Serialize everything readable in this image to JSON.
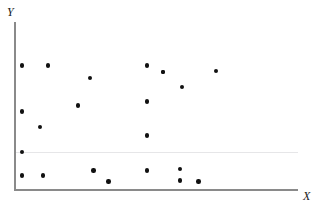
{
  "chart_data": {
    "type": "scatter",
    "title": "",
    "subtitle": "",
    "xlabel": "X",
    "ylabel": "Y",
    "xlim": [
      0,
      100
    ],
    "ylim": [
      0,
      100
    ],
    "grid": false,
    "legend": null,
    "series": [
      {
        "name": "observations",
        "marker": "filled-circle",
        "color": "#111111",
        "point_count": 22,
        "points": [
          {
            "x": 2.5,
            "y": 74.0
          },
          {
            "x": 11.7,
            "y": 74.0
          },
          {
            "x": 26.6,
            "y": 66.5
          },
          {
            "x": 46.8,
            "y": 74.0
          },
          {
            "x": 52.5,
            "y": 70.0
          },
          {
            "x": 59.2,
            "y": 61.0
          },
          {
            "x": 71.3,
            "y": 70.5
          },
          {
            "x": 2.5,
            "y": 46.5
          },
          {
            "x": 8.9,
            "y": 37.0
          },
          {
            "x": 22.3,
            "y": 50.0
          },
          {
            "x": 46.8,
            "y": 52.5
          },
          {
            "x": 46.8,
            "y": 32.0
          },
          {
            "x": 2.5,
            "y": 22.0
          },
          {
            "x": 2.5,
            "y": 8.0
          },
          {
            "x": 9.9,
            "y": 8.0
          },
          {
            "x": 27.9,
            "y": 11.0
          },
          {
            "x": 33.2,
            "y": 4.5
          },
          {
            "x": 46.8,
            "y": 11.0
          },
          {
            "x": 58.5,
            "y": 12.0
          },
          {
            "x": 58.5,
            "y": 5.0
          },
          {
            "x": 65.0,
            "y": 4.5
          },
          {
            "x": 52.5,
            "y": 70.0
          }
        ]
      }
    ],
    "axes": {
      "x_axis_visible": true,
      "y_axis_visible": true,
      "x_ticks": [],
      "y_ticks": [],
      "axis_color": "#8a8a8a"
    },
    "annotations": []
  },
  "plot": {
    "background_color": "#ffffff",
    "marker_color": "#111111",
    "axis_color": "#8a8a8a",
    "y_label": "Y",
    "x_label": "X"
  }
}
